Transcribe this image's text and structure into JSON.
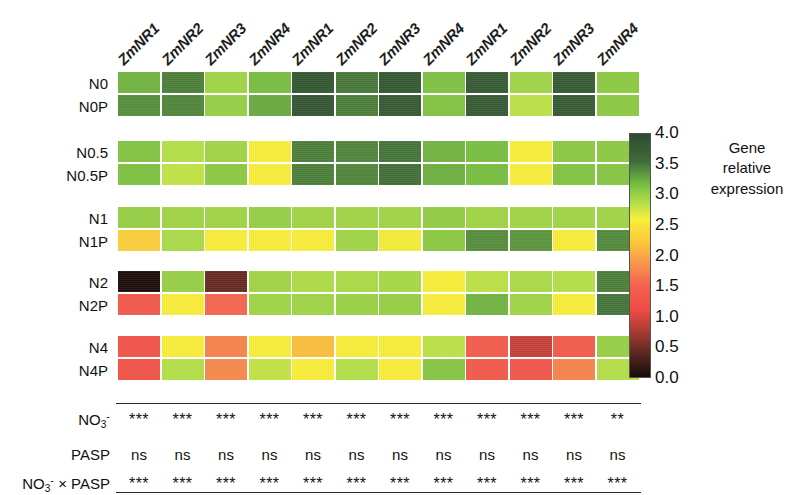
{
  "figure": {
    "row_groups": [
      "N0",
      "N0.5",
      "N1",
      "N2",
      "N4"
    ],
    "row_labels": [
      [
        "N0",
        "N0P"
      ],
      [
        "N0.5",
        "N0.5P"
      ],
      [
        "N1",
        "N1P"
      ],
      [
        "N2",
        "N2P"
      ],
      [
        "N4",
        "N4P"
      ]
    ],
    "columns": [
      "ZmNR1",
      "ZmNR2",
      "ZmNR3",
      "ZmNR4"
    ],
    "panels": [
      "panel-1",
      "panel-2",
      "panel-3"
    ]
  },
  "colorbar": {
    "title_line1": "Gene",
    "title_line2": "relative",
    "title_line3": "expression",
    "ticks": [
      "4.0",
      "3.5",
      "3.0",
      "2.5",
      "2.0",
      "1.5",
      "1.0",
      "0.5",
      "0.0"
    ],
    "min": 0.0,
    "max": 4.0,
    "stops": [
      {
        "value": 0.0,
        "color": "#2f4a30"
      },
      {
        "value": 0.45,
        "color": "#3f6b3a"
      },
      {
        "value": 0.85,
        "color": "#7ac043"
      },
      {
        "value": 1.15,
        "color": "#b5e04a"
      },
      {
        "value": 1.4,
        "color": "#f9ee3a"
      },
      {
        "value": 1.8,
        "color": "#fbc63c"
      },
      {
        "value": 2.1,
        "color": "#f89a4e"
      },
      {
        "value": 2.5,
        "color": "#f4604f"
      },
      {
        "value": 2.9,
        "color": "#ef4a45"
      },
      {
        "value": 3.3,
        "color": "#9c3a32"
      },
      {
        "value": 3.7,
        "color": "#4a221c"
      },
      {
        "value": 4.0,
        "color": "#150b0a"
      }
    ]
  },
  "chart_data": {
    "type": "heatmap",
    "title": "",
    "xlabel": "",
    "ylabel": "",
    "colorbar_label": "Gene relative expression",
    "zlim": [
      0.0,
      4.0
    ],
    "columns": [
      "ZmNR1",
      "ZmNR2",
      "ZmNR3",
      "ZmNR4"
    ],
    "rows": [
      "N0",
      "N0P",
      "N0.5",
      "N0.5P",
      "N1",
      "N1P",
      "N2",
      "N2P",
      "N4",
      "N4P"
    ],
    "panels": [
      {
        "name": "panel-1",
        "values": [
          [
            0.8,
            0.55,
            1.05,
            0.85
          ],
          [
            0.62,
            0.58,
            1.0,
            0.75
          ],
          [
            0.9,
            1.15,
            1.05,
            1.4
          ],
          [
            0.88,
            1.2,
            0.95,
            1.4
          ],
          [
            1.0,
            1.05,
            1.05,
            1.0
          ],
          [
            1.7,
            1.1,
            1.4,
            1.4
          ],
          [
            3.95,
            1.0,
            3.55,
            1.05
          ],
          [
            2.6,
            1.4,
            2.45,
            1.05
          ],
          [
            2.7,
            1.4,
            2.25,
            1.4
          ],
          [
            2.7,
            1.15,
            2.2,
            1.2
          ]
        ]
      },
      {
        "name": "panel-2",
        "values": [
          [
            0.2,
            0.52,
            0.22,
            0.88
          ],
          [
            0.18,
            0.55,
            0.25,
            0.9
          ],
          [
            0.55,
            0.58,
            0.5,
            0.8
          ],
          [
            0.55,
            0.58,
            0.48,
            0.78
          ],
          [
            1.05,
            1.05,
            1.05,
            0.98
          ],
          [
            1.4,
            1.05,
            1.38,
            0.95
          ],
          [
            1.12,
            1.1,
            1.08,
            1.4
          ],
          [
            1.05,
            1.02,
            1.0,
            1.4
          ],
          [
            1.85,
            1.4,
            1.4,
            1.18
          ],
          [
            1.4,
            1.15,
            1.4,
            0.92
          ]
        ]
      },
      {
        "name": "panel-3",
        "values": [
          [
            0.25,
            1.05,
            0.25,
            0.95
          ],
          [
            0.25,
            1.18,
            0.25,
            0.95
          ],
          [
            0.85,
            1.4,
            0.95,
            0.95
          ],
          [
            0.85,
            1.4,
            0.9,
            0.92
          ],
          [
            1.05,
            1.05,
            1.05,
            1.05
          ],
          [
            0.62,
            0.65,
            1.4,
            0.6
          ],
          [
            1.18,
            1.1,
            1.15,
            0.55
          ],
          [
            0.8,
            1.05,
            1.4,
            0.5
          ],
          [
            2.55,
            3.1,
            2.55,
            1.0
          ],
          [
            2.6,
            2.65,
            2.25,
            1.15
          ]
        ]
      }
    ]
  },
  "stats": {
    "row_labels": [
      {
        "html": "NO<sub>3</sub><sup>-</sup>",
        "text": "NO3-"
      },
      {
        "html": "PASP",
        "text": "PASP"
      },
      {
        "html": "NO<sub>3</sub><sup>-</sup> × PASP",
        "text": "NO3- x PASP"
      }
    ],
    "panels": [
      {
        "name": "panel-1",
        "rows": [
          [
            "***",
            "***",
            "***",
            "***"
          ],
          [
            "ns",
            "ns",
            "ns",
            "ns"
          ],
          [
            "***",
            "***",
            "***",
            "***"
          ]
        ]
      },
      {
        "name": "panel-2",
        "rows": [
          [
            "***",
            "***",
            "***",
            "***"
          ],
          [
            "ns",
            "ns",
            "ns",
            "ns"
          ],
          [
            "***",
            "***",
            "***",
            "***"
          ]
        ]
      },
      {
        "name": "panel-3",
        "rows": [
          [
            "***",
            "***",
            "***",
            "**"
          ],
          [
            "ns",
            "ns",
            "ns",
            "ns"
          ],
          [
            "***",
            "***",
            "***",
            "***"
          ]
        ]
      }
    ]
  }
}
